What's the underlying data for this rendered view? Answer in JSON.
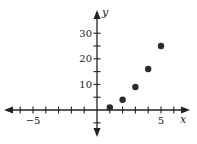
{
  "chart_data": {
    "type": "scatter",
    "title": "",
    "xlabel": "x",
    "ylabel": "y",
    "x": [
      1,
      2,
      3,
      4,
      5
    ],
    "series": [
      {
        "name": "points",
        "values": [
          1,
          4,
          9,
          16,
          25
        ]
      }
    ],
    "xlim": [
      -6.5,
      6.5
    ],
    "ylim": [
      -6,
      35
    ],
    "x_ticks": [
      -6,
      -5,
      -4,
      -3,
      -2,
      -1,
      1,
      2,
      3,
      4,
      5,
      6
    ],
    "x_tick_labels": {
      "-5": "−5",
      "5": "5"
    },
    "y_ticks": [
      -5,
      5,
      10,
      15,
      20,
      25,
      30
    ],
    "y_tick_labels": {
      "10": "10",
      "20": "20",
      "30": "30"
    },
    "grid": false,
    "legend": "none",
    "point_color": "#2b2b2b",
    "axis_color": "#222222"
  },
  "axes": {
    "x_label": "x",
    "y_label": "y"
  }
}
